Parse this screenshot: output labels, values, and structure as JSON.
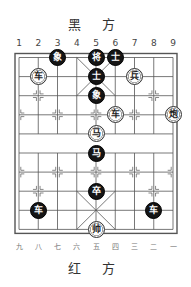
{
  "header": {
    "black_side_label": "黑 方"
  },
  "footer": {
    "red_side_label": "红 方"
  },
  "columns_top": [
    "1",
    "2",
    "3",
    "4",
    "5",
    "6",
    "7",
    "8",
    "9"
  ],
  "columns_bottom": [
    "九",
    "八",
    "七",
    "六",
    "五",
    "四",
    "三",
    "二",
    "一"
  ],
  "colors": {
    "board_line": "#555555",
    "black_piece": "#151515",
    "red_piece_bg": "#ffffff"
  },
  "pieces": [
    {
      "side": "black",
      "label": "象",
      "col": 3,
      "row": 0
    },
    {
      "side": "black",
      "label": "将",
      "col": 5,
      "row": 0
    },
    {
      "side": "black",
      "label": "士",
      "col": 6,
      "row": 0
    },
    {
      "side": "black",
      "label": "士",
      "col": 5,
      "row": 1
    },
    {
      "side": "black",
      "label": "象",
      "col": 5,
      "row": 2
    },
    {
      "side": "black",
      "label": "马",
      "col": 5,
      "row": 5
    },
    {
      "side": "black",
      "label": "卒",
      "col": 5,
      "row": 7
    },
    {
      "side": "black",
      "label": "车",
      "col": 2,
      "row": 8
    },
    {
      "side": "black",
      "label": "车",
      "col": 8,
      "row": 8
    },
    {
      "side": "red",
      "label": "车",
      "col": 2,
      "row": 1
    },
    {
      "side": "red",
      "label": "兵",
      "col": 7,
      "row": 1
    },
    {
      "side": "red",
      "label": "车",
      "col": 6,
      "row": 3
    },
    {
      "side": "red",
      "label": "炮",
      "col": 9,
      "row": 3
    },
    {
      "side": "red",
      "label": "马",
      "col": 5,
      "row": 4
    },
    {
      "side": "red",
      "label": "帅",
      "col": 5,
      "row": 9
    }
  ]
}
